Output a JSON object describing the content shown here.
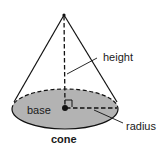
{
  "diagram": {
    "title": "cone",
    "labels": {
      "height": "height",
      "radius": "radius",
      "base": "base"
    },
    "colors": {
      "base_fill": "#b3b3b3",
      "stroke": "#111111",
      "background": "#ffffff"
    }
  }
}
